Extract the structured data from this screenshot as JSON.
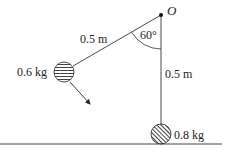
{
  "diagram": {
    "type": "pendulum-collision",
    "pivot": {
      "label": "O"
    },
    "angle": {
      "label": "60°",
      "value_deg": 60
    },
    "strings": [
      {
        "id": "inclined",
        "length_label": "0.5 m"
      },
      {
        "id": "vertical",
        "length_label": "0.5 m"
      }
    ],
    "masses": [
      {
        "id": "swinging",
        "label": "0.6 kg",
        "hatch": "horizontal"
      },
      {
        "id": "resting",
        "label": "0.8 kg",
        "hatch": "diagonal"
      }
    ],
    "motion_arrow": {
      "direction": "down-right"
    },
    "colors": {
      "line": "#222222",
      "ball_fill": "#ffffff",
      "hatch": "#444444"
    }
  }
}
